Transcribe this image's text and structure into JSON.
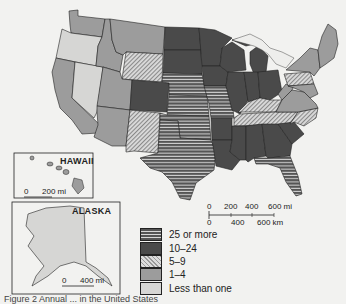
{
  "map": {
    "title": "",
    "insets": {
      "hawaii": {
        "label": "HAWAII",
        "scale": {
          "zero": "0",
          "value": "200 mi"
        }
      },
      "alaska": {
        "label": "ALASKA",
        "scale": {
          "zero": "0",
          "value": "400 mi"
        }
      }
    },
    "scale_bar": {
      "miles": [
        "0",
        "200",
        "400",
        "600 mi"
      ],
      "km": [
        "0",
        "400",
        "600 km"
      ]
    }
  },
  "legend": {
    "items": [
      {
        "key": "25plus",
        "label": "25 or more",
        "pattern": "horizontal-stripes"
      },
      {
        "key": "10to24",
        "label": "10–24",
        "pattern": "dark-solid"
      },
      {
        "key": "5to9",
        "label": "5–9",
        "pattern": "diagonal-hatch"
      },
      {
        "key": "1to4",
        "label": "1–4",
        "pattern": "medium-gray"
      },
      {
        "key": "lt1",
        "label": "Less than one",
        "pattern": "light-gray"
      }
    ]
  },
  "colors": {
    "dark": "#4a4a4a",
    "medium": "#9c9c9c",
    "light": "#d6d6d4",
    "border": "#222222",
    "background": "#f2f2f0"
  },
  "caption": "Figure 2  Annual ... in the United States"
}
